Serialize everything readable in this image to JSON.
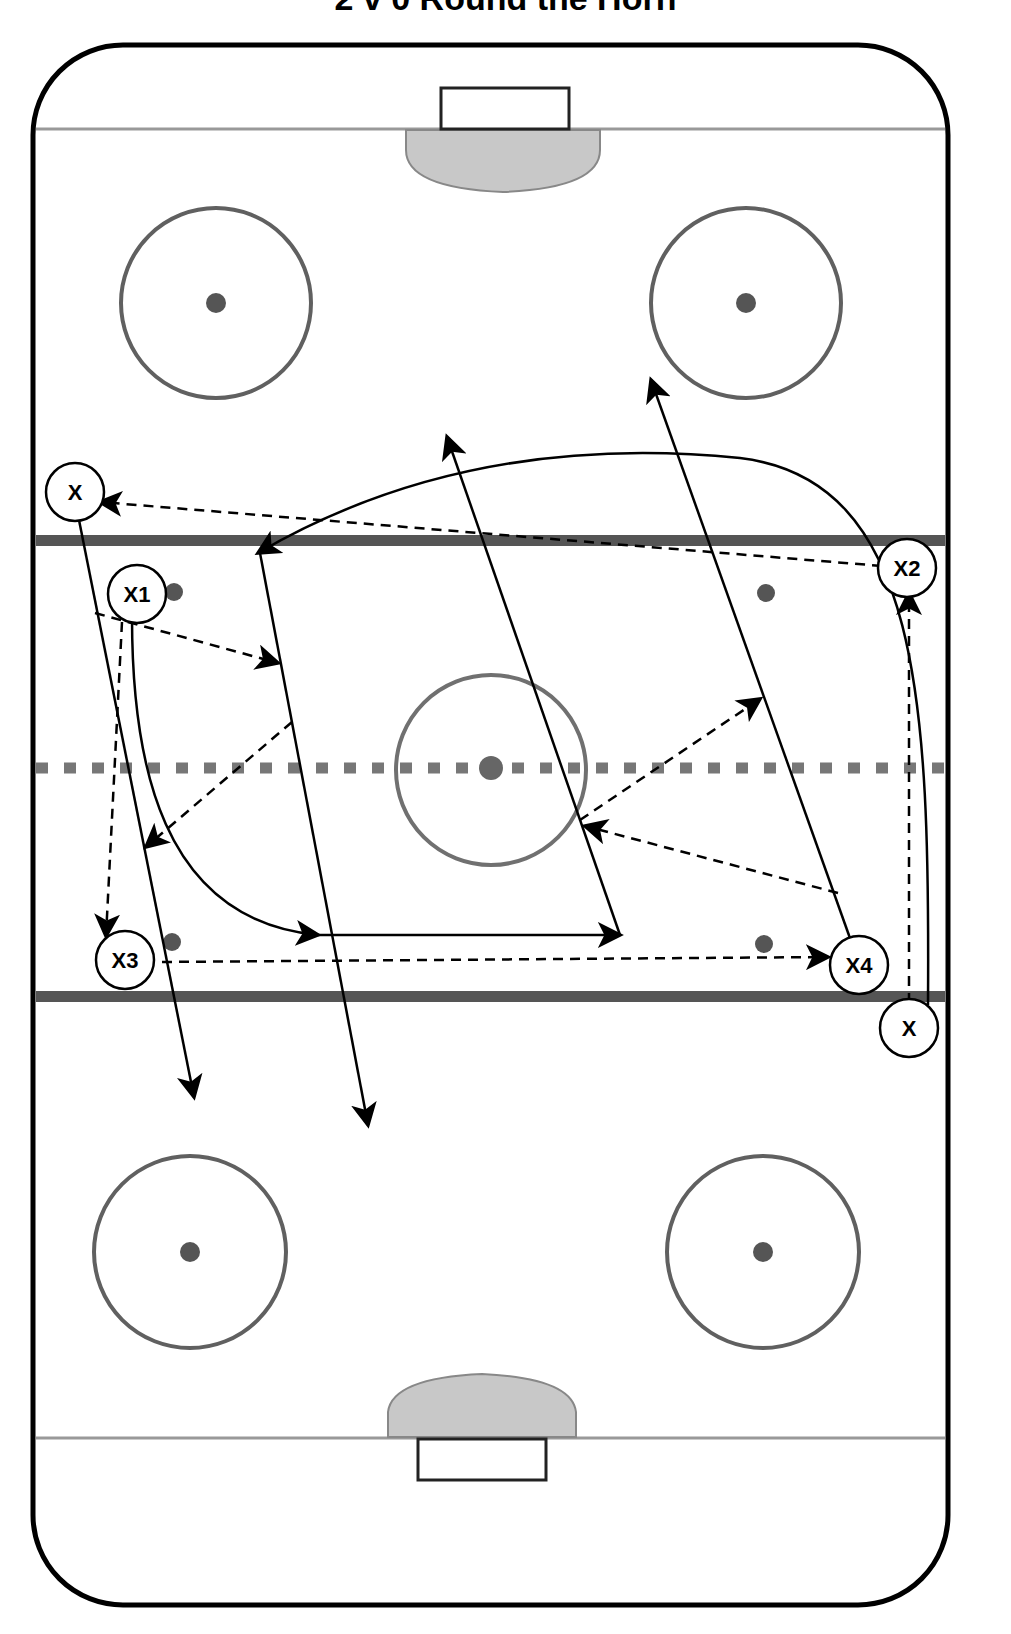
{
  "title": "2 v 0 Round the Horn",
  "colors": {
    "board": "#000000",
    "blue_line": "#555555",
    "red_line": "#777777",
    "goal_line": "#999999",
    "crease": "#c8c8c8",
    "circle": "#606060",
    "dot": "#555555",
    "path": "#000000"
  },
  "legend": {
    "solid_line": "skate path",
    "dashed_line": "pass"
  },
  "players": [
    {
      "id": "x-top-left",
      "label": "X",
      "cx": 75,
      "cy": 492
    },
    {
      "id": "x1",
      "label": "X1",
      "cx": 137,
      "cy": 594
    },
    {
      "id": "x2",
      "label": "X2",
      "cx": 907,
      "cy": 568
    },
    {
      "id": "x3",
      "label": "X3",
      "cx": 125,
      "cy": 960
    },
    {
      "id": "x4",
      "label": "X4",
      "cx": 859,
      "cy": 965
    },
    {
      "id": "x-bottom-right",
      "label": "X",
      "cx": 909,
      "cy": 1028
    }
  ]
}
